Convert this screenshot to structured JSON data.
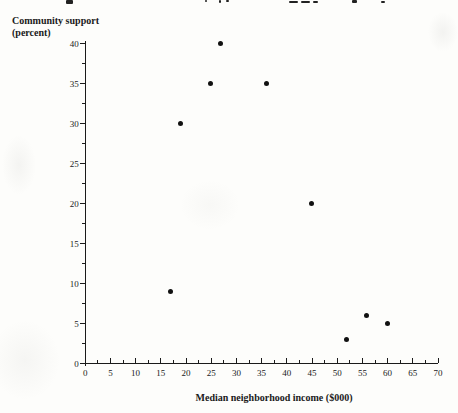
{
  "figure": {
    "y_axis_title_line1": "Community support",
    "y_axis_title_line2": "(percent)",
    "x_axis_title": "Median neighborhood income ($000)"
  },
  "chart_data": {
    "type": "scatter",
    "title": "",
    "xlabel": "Median neighborhood income ($000)",
    "ylabel": "Community support (percent)",
    "xlim": [
      0,
      70
    ],
    "ylim": [
      0,
      40
    ],
    "x_ticks": [
      0,
      5,
      10,
      15,
      20,
      25,
      30,
      35,
      40,
      45,
      50,
      55,
      60,
      65,
      70
    ],
    "y_ticks": [
      0,
      5,
      10,
      15,
      20,
      25,
      30,
      35,
      40
    ],
    "x_minor_step": 2.5,
    "y_minor_step": 2.5,
    "grid": false,
    "legend": "none",
    "axis_color": "#1a1a1a",
    "marker": {
      "shape": "circle",
      "color": "#111111",
      "diameter_px": 5
    },
    "points": [
      {
        "x": 17,
        "y": 9
      },
      {
        "x": 19,
        "y": 30
      },
      {
        "x": 25,
        "y": 35
      },
      {
        "x": 27,
        "y": 40
      },
      {
        "x": 36,
        "y": 35
      },
      {
        "x": 45,
        "y": 20
      },
      {
        "x": 52,
        "y": 3
      },
      {
        "x": 56,
        "y": 6
      },
      {
        "x": 60,
        "y": 5
      }
    ]
  }
}
